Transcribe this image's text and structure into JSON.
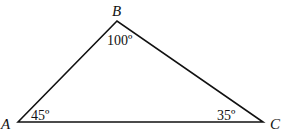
{
  "diagram": {
    "type": "triangle",
    "vertices": [
      {
        "label": "A",
        "angle": "45º"
      },
      {
        "label": "B",
        "angle": "100º"
      },
      {
        "label": "C",
        "angle": "35º"
      }
    ],
    "stroke_color": "#111111"
  }
}
